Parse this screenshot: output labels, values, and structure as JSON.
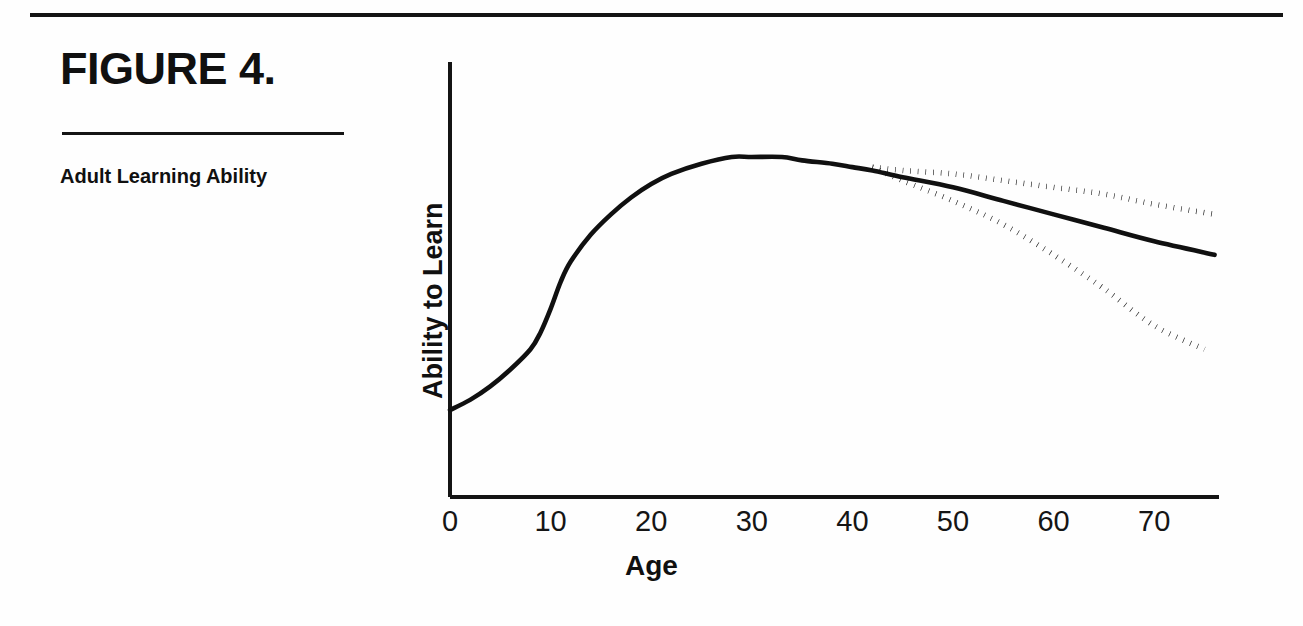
{
  "figure": {
    "title": "FIGURE 4.",
    "caption": "Adult Learning Ability"
  },
  "chart_data": {
    "type": "line",
    "title": "Adult Learning Ability",
    "xlabel": "Age",
    "ylabel": "Ability to Learn",
    "xlim": [
      0,
      76
    ],
    "ylim": [
      0,
      100
    ],
    "xticks": [
      0,
      10,
      20,
      30,
      40,
      50,
      60,
      70
    ],
    "xtick_labels": [
      "0",
      "10",
      "20",
      "30",
      "40",
      "50",
      "60",
      "70"
    ],
    "yticks": [],
    "ytick_labels": [],
    "grid": false,
    "legend": false,
    "axes": {
      "left": true,
      "bottom": true,
      "top": false,
      "right": false
    },
    "series": [
      {
        "name": "Ability to learn (measured)",
        "style": "solid",
        "color": "#101010",
        "x": [
          0,
          2,
          4,
          6,
          8,
          9,
          10,
          11,
          12,
          14,
          16,
          18,
          20,
          22,
          25,
          28,
          30,
          33,
          35,
          38,
          40,
          42,
          45,
          50,
          55,
          60,
          65,
          70,
          76
        ],
        "y": [
          20,
          23,
          27,
          32,
          38,
          43,
          50,
          58,
          64,
          72,
          78,
          83,
          87,
          90,
          93,
          95,
          95,
          95,
          94,
          93,
          92,
          91,
          89,
          86,
          82,
          78,
          74,
          70,
          66
        ]
      },
      {
        "name": "Projected decline — optimistic",
        "style": "dotted",
        "color": "#101010",
        "x": [
          42,
          45,
          50,
          55,
          60,
          65,
          70,
          76
        ],
        "y": [
          92,
          91,
          90,
          88,
          86,
          84,
          81,
          78
        ]
      },
      {
        "name": "Projected decline — pessimistic",
        "style": "dotted",
        "color": "#101010",
        "x": [
          42,
          45,
          50,
          55,
          60,
          65,
          70,
          75
        ],
        "y": [
          92,
          88,
          82,
          75,
          66,
          56,
          45,
          38
        ]
      }
    ],
    "annotations": [
      {
        "text": "Curves diverge at about age 43 into three projections",
        "x": 43,
        "y": 92
      }
    ]
  },
  "axis": {
    "x_title": "Age",
    "y_title": "Ability to Learn"
  }
}
